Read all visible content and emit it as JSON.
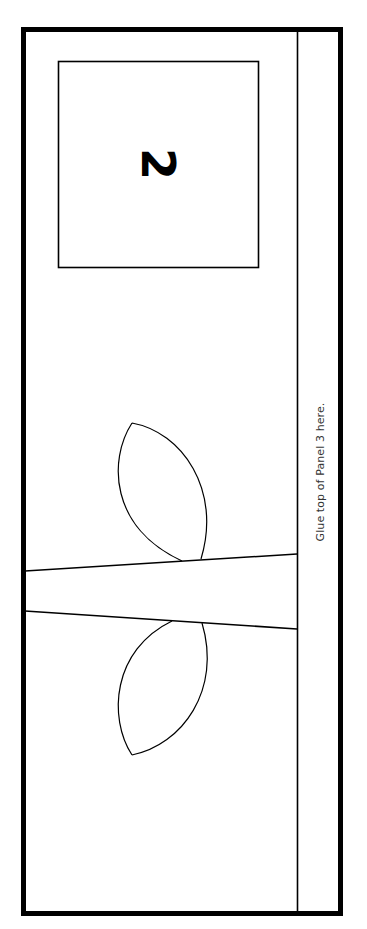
{
  "panel": {
    "number": "2",
    "glue_instruction": "Glue top of Panel 3 here.",
    "colors": {
      "line": "#000000",
      "background": "#ffffff",
      "text": "#333333"
    }
  }
}
